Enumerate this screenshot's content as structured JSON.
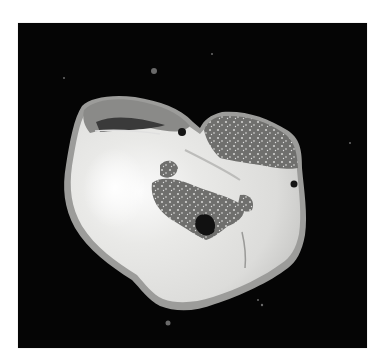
{
  "image": {
    "subject": "gross-specimen-cross-section",
    "background_color": "#050505",
    "page_background": "#ffffff",
    "tissue_colors": {
      "pale_body": "#e6e6e4",
      "highlight": "#fafafa",
      "capsule_rim": "#9a9a98",
      "mottled_region": "#7a7a78",
      "dark_spots": "#1a1a1a"
    }
  }
}
